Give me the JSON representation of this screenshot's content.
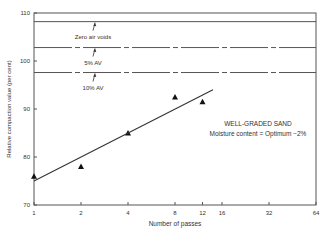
{
  "chart_data": {
    "type": "scatter",
    "title": "",
    "xlabel": "Number of passes",
    "ylabel": "Relative compaction value (per cent)",
    "x_scale": "log2",
    "xlim": [
      1,
      64
    ],
    "ylim": [
      70,
      110
    ],
    "x_ticks": [
      1,
      2,
      4,
      8,
      12,
      16,
      32,
      64
    ],
    "y_ticks": [
      70,
      80,
      90,
      100,
      110
    ],
    "grid": false,
    "series": [
      {
        "name": "Measured",
        "marker": "triangle",
        "points": [
          {
            "x": 1,
            "y": 76
          },
          {
            "x": 2,
            "y": 78
          },
          {
            "x": 4,
            "y": 85
          },
          {
            "x": 8,
            "y": 92.5
          },
          {
            "x": 12,
            "y": 91.5
          }
        ]
      },
      {
        "name": "Trend line",
        "type": "line",
        "points": [
          {
            "x": 1,
            "y": 75
          },
          {
            "x": 14,
            "y": 94
          }
        ]
      }
    ],
    "reference_lines": [
      {
        "label": "Zero air voids",
        "y": 108.2,
        "style": "solid"
      },
      {
        "label": "5% AV",
        "y": 102.8,
        "style": "dash-dot"
      },
      {
        "label": "10% AV",
        "y": 97.6,
        "style": "dash-dot"
      }
    ],
    "annotations": [
      {
        "text": "WELL-GRADED SAND"
      },
      {
        "text": "Moisture content = Optimum −2%"
      }
    ]
  }
}
